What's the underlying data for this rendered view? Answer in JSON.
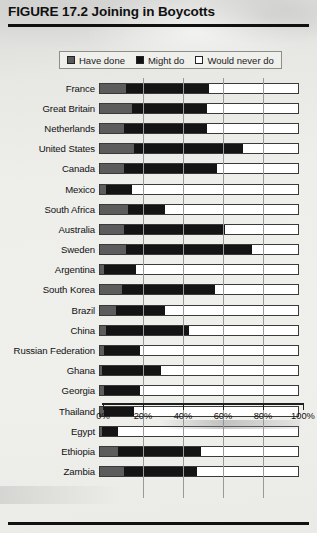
{
  "figure": {
    "title": "FIGURE 17.2 Joining in Boycotts"
  },
  "legend": {
    "items": [
      {
        "label": "Have done",
        "swatch": "gray-square-icon",
        "color": "#5c5c5c"
      },
      {
        "label": "Might do",
        "swatch": "black-square-icon",
        "color": "#141414"
      },
      {
        "label": "Would never do",
        "swatch": "white-square-icon",
        "color": "#ffffff"
      }
    ]
  },
  "axis": {
    "tick_labels": [
      "0%",
      "20%",
      "40%",
      "60%",
      "80%",
      "100%"
    ],
    "tick_values": [
      0,
      20,
      40,
      60,
      80,
      100
    ]
  },
  "chart_data": {
    "type": "bar",
    "orientation": "horizontal",
    "stacked": true,
    "title": "FIGURE 17.2 Joining in Boycotts",
    "xlabel": "",
    "ylabel": "",
    "xlim": [
      0,
      100
    ],
    "xticks": [
      0,
      20,
      40,
      60,
      80,
      100
    ],
    "xtick_labels": [
      "0%",
      "20%",
      "40%",
      "60%",
      "80%",
      "100%"
    ],
    "grid": true,
    "legend_position": "top-center",
    "categories": [
      "France",
      "Great Britain",
      "Netherlands",
      "United States",
      "Canada",
      "Mexico",
      "South Africa",
      "Australia",
      "Sweden",
      "Argentina",
      "South Korea",
      "Brazil",
      "China",
      "Russian Federation",
      "Ghana",
      "Georgia",
      "Thailand",
      "Egypt",
      "Ethiopia",
      "Zambia"
    ],
    "series": [
      {
        "name": "Have done",
        "color": "#5c5c5c",
        "values": [
          13,
          16,
          12,
          17,
          12,
          3,
          14,
          12,
          13,
          2,
          11,
          8,
          3,
          2,
          1,
          2,
          2,
          1,
          9,
          12
        ]
      },
      {
        "name": "Might do",
        "color": "#141414",
        "values": [
          42,
          38,
          42,
          55,
          47,
          13,
          19,
          51,
          64,
          16,
          47,
          25,
          42,
          18,
          30,
          18,
          15,
          8,
          42,
          37
        ]
      },
      {
        "name": "Would never do",
        "color": "#ffffff",
        "values": [
          45,
          46,
          46,
          28,
          41,
          84,
          67,
          37,
          23,
          82,
          42,
          67,
          55,
          80,
          69,
          80,
          83,
          91,
          49,
          51
        ]
      }
    ]
  }
}
